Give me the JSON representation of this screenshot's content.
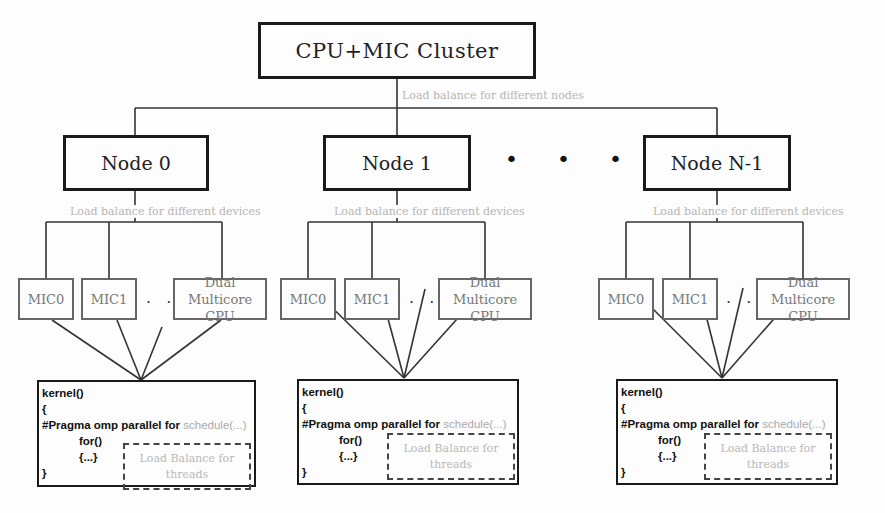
{
  "cluster": {
    "label": "CPU+MIC Cluster"
  },
  "cluster_annotation": "Load balance for different nodes",
  "nodes": [
    {
      "label": "Node 0",
      "annotation": "Load balance for different devices",
      "devices": [
        {
          "label": "MIC0"
        },
        {
          "label": "MIC1"
        },
        {
          "label": "Dual Multicore CPU"
        }
      ],
      "device_ellipsis": ". . .",
      "kernel": {
        "line1": "kernel()",
        "line2": "{",
        "pragma": "#Pragma omp parallel for",
        "schedule": "schedule(...)",
        "for": "for()",
        "body": "{...}",
        "close": "}",
        "thread_lb": "Load Balance for threads"
      }
    },
    {
      "label": "Node 1",
      "annotation": "Load balance for different devices",
      "devices": [
        {
          "label": "MIC0"
        },
        {
          "label": "MIC1"
        },
        {
          "label": "Dual Multicore CPU"
        }
      ],
      "device_ellipsis": ". . .",
      "kernel": {
        "line1": "kernel()",
        "line2": "{",
        "pragma": "#Pragma omp parallel for",
        "schedule": "schedule(...)",
        "for": "for()",
        "body": "{...}",
        "close": "}",
        "thread_lb": "Load Balance for threads"
      }
    },
    {
      "label": "Node N-1",
      "annotation": "Load balance for different devices",
      "devices": [
        {
          "label": "MIC0"
        },
        {
          "label": "MIC1"
        },
        {
          "label": "Dual Multicore CPU"
        }
      ],
      "device_ellipsis": ". . .",
      "kernel": {
        "line1": "kernel()",
        "line2": "{",
        "pragma": "#Pragma omp parallel for",
        "schedule": "schedule(...)",
        "for": "for()",
        "body": "{...}",
        "close": "}",
        "thread_lb": "Load Balance for threads"
      }
    }
  ],
  "node_ellipsis": "• • •"
}
